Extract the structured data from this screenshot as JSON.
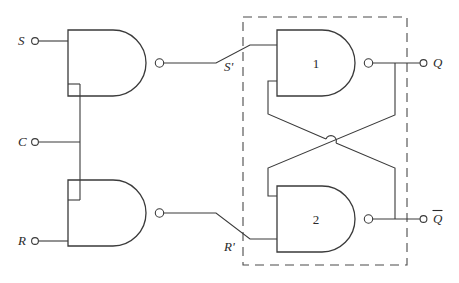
{
  "figure": {
    "kind": "logic-circuit-diagram",
    "background_color": "#ffffff",
    "line_color": "#3a3a3a",
    "text_color": "#2a2a2a",
    "dashed_box_color": "#4a4a4a"
  },
  "inputs": [
    {
      "id": "S",
      "label": "S",
      "x": 22,
      "y": 41
    },
    {
      "id": "C",
      "label": "C",
      "x": 22,
      "y": 142
    },
    {
      "id": "R",
      "label": "R",
      "x": 22,
      "y": 241
    }
  ],
  "outputs": [
    {
      "id": "Q",
      "label": "Q",
      "overbar": false,
      "x": 437,
      "y": 60
    },
    {
      "id": "Qbar",
      "label": "Q",
      "overbar": true,
      "x": 437,
      "y": 233
    }
  ],
  "internal_signals": [
    {
      "id": "Sprime",
      "label": "S'",
      "x": 228,
      "y": 67
    },
    {
      "id": "Rprime",
      "label": "R'",
      "x": 228,
      "y": 247
    }
  ],
  "gates": [
    {
      "id": "nand-s",
      "type": "NAND",
      "number": "",
      "inputs": [
        "S",
        "C"
      ],
      "output": "S'"
    },
    {
      "id": "nand-r",
      "type": "NAND",
      "number": "",
      "inputs": [
        "C",
        "R"
      ],
      "output": "R'"
    },
    {
      "id": "nand-1",
      "type": "NAND",
      "number": "1",
      "inputs": [
        "S'",
        "Qbar"
      ],
      "output": "Q"
    },
    {
      "id": "nand-2",
      "type": "NAND",
      "number": "2",
      "inputs": [
        "Q",
        "R'"
      ],
      "output": "Qbar"
    }
  ],
  "dashed_region": {
    "label": "",
    "contains": [
      "nand-1",
      "nand-2"
    ],
    "x": 243,
    "y": 17,
    "width": 164,
    "height": 248
  },
  "crossover": {
    "style": "wire-hop",
    "note": "crossing feedback wires are not connected"
  }
}
